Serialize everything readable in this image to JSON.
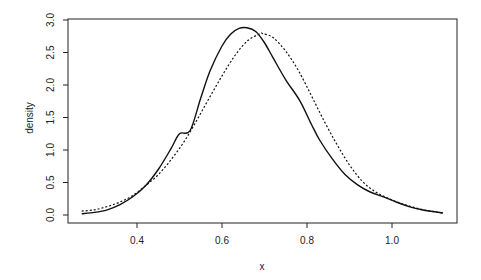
{
  "chart_data": {
    "type": "line",
    "title": "",
    "xlabel": "x",
    "ylabel": "density",
    "xlim": [
      0.238,
      1.153
    ],
    "ylim": [
      0.0,
      3.0
    ],
    "grid": false,
    "legend": null,
    "x_ticks": [
      0.4,
      0.6,
      0.8,
      1.0
    ],
    "x_tick_labels": [
      "0.4",
      "0.6",
      "0.8",
      "1.0"
    ],
    "y_ticks": [
      0.0,
      0.5,
      1.0,
      1.5,
      2.0,
      2.5,
      3.0
    ],
    "y_tick_labels": [
      "0.0",
      "0.5",
      "1.0",
      "1.5",
      "2.0",
      "2.5",
      "3.0"
    ],
    "series": [
      {
        "name": "density-solid",
        "style": "solid",
        "x": [
          0.27,
          0.3,
          0.33,
          0.36,
          0.39,
          0.42,
          0.45,
          0.48,
          0.5,
          0.525,
          0.55,
          0.572,
          0.6,
          0.62,
          0.64,
          0.659,
          0.68,
          0.7,
          0.72,
          0.75,
          0.783,
          0.81,
          0.83,
          0.86,
          0.89,
          0.92,
          0.95,
          0.98,
          1.01,
          1.04,
          1.07,
          1.1,
          1.12
        ],
        "y": [
          0.02,
          0.04,
          0.08,
          0.16,
          0.28,
          0.45,
          0.7,
          1.02,
          1.25,
          1.3,
          1.8,
          2.22,
          2.6,
          2.78,
          2.87,
          2.88,
          2.82,
          2.65,
          2.42,
          2.08,
          1.76,
          1.4,
          1.15,
          0.86,
          0.62,
          0.46,
          0.35,
          0.28,
          0.2,
          0.13,
          0.08,
          0.05,
          0.03
        ]
      },
      {
        "name": "density-dashed",
        "style": "dashed",
        "x": [
          0.27,
          0.3,
          0.33,
          0.36,
          0.39,
          0.42,
          0.45,
          0.48,
          0.51,
          0.54,
          0.57,
          0.6,
          0.63,
          0.66,
          0.69,
          0.696,
          0.72,
          0.75,
          0.78,
          0.81,
          0.84,
          0.87,
          0.9,
          0.93,
          0.96,
          0.99,
          1.02,
          1.05,
          1.08,
          1.1,
          1.12
        ],
        "y": [
          0.06,
          0.08,
          0.13,
          0.2,
          0.3,
          0.45,
          0.62,
          0.85,
          1.12,
          1.45,
          1.8,
          2.14,
          2.45,
          2.68,
          2.79,
          2.79,
          2.73,
          2.52,
          2.22,
          1.84,
          1.45,
          1.09,
          0.77,
          0.52,
          0.36,
          0.26,
          0.18,
          0.12,
          0.07,
          0.05,
          0.03
        ]
      }
    ]
  }
}
